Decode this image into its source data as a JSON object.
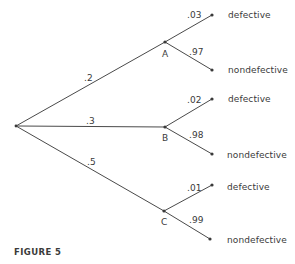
{
  "figure": {
    "caption": "FIGURE 5",
    "line_color": "#4a4a4a"
  },
  "tree": {
    "root": {
      "x": 16,
      "y": 126
    },
    "branches": [
      {
        "node": "A",
        "prob": ".2",
        "x": 165,
        "y": 42,
        "outcomes": [
          {
            "label": "defective",
            "prob": ".03",
            "x": 212,
            "y": 15
          },
          {
            "label": "nondefective",
            "prob": ".97",
            "x": 212,
            "y": 70
          }
        ]
      },
      {
        "node": "B",
        "prob": ".3",
        "x": 165,
        "y": 127,
        "outcomes": [
          {
            "label": "defective",
            "prob": ".02",
            "x": 212,
            "y": 99
          },
          {
            "label": "nondefective",
            "prob": ".98",
            "x": 212,
            "y": 154
          }
        ]
      },
      {
        "node": "C",
        "prob": ".5",
        "x": 164,
        "y": 211,
        "outcomes": [
          {
            "label": "defective",
            "prob": ".01",
            "x": 212,
            "y": 185
          },
          {
            "label": "nondefective",
            "prob": ".99",
            "x": 210,
            "y": 239
          }
        ]
      }
    ]
  }
}
